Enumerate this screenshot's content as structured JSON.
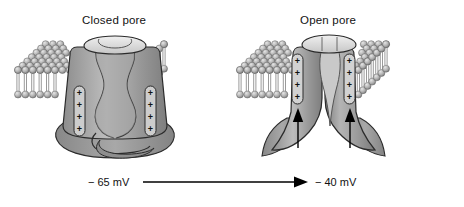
{
  "figure": {
    "title_closed": "Closed pore",
    "title_open": "Open pore",
    "voltage_start": "− 65 mV",
    "voltage_end": "− 40 mV",
    "sensor_charge": "+",
    "charges_per_sensor": 4,
    "background": "#ffffff",
    "colors": {
      "protein_mid": "#9a9a9a",
      "protein_light": "#cfcfcf",
      "protein_dark": "#7d7d7d",
      "pore_mouth": "#e2e2e2",
      "lipid_head": "#b9b9b9",
      "lipid_tail": "#8f8f8f",
      "outline": "#2b2b2b",
      "arrow": "#000000"
    }
  },
  "chart_data": {
    "type": "diagram",
    "panels": [
      {
        "label": "Closed pore",
        "state": "closed",
        "membrane_potential": "− 65 mV",
        "voltage_sensors": 2,
        "charges_per_sensor": 4,
        "pore_open": false,
        "inactivation_loop_visible": true,
        "sensor_arrows": 0
      },
      {
        "label": "Open pore",
        "state": "open",
        "membrane_potential": "− 40 mV",
        "voltage_sensors": 2,
        "charges_per_sensor": 4,
        "pore_open": true,
        "inactivation_loop_visible": false,
        "sensor_arrows": 2
      }
    ],
    "transition": {
      "from": "− 65 mV",
      "to": "− 40 mV",
      "direction": "left-to-right",
      "meaning": "depolarization opens the pore"
    }
  }
}
